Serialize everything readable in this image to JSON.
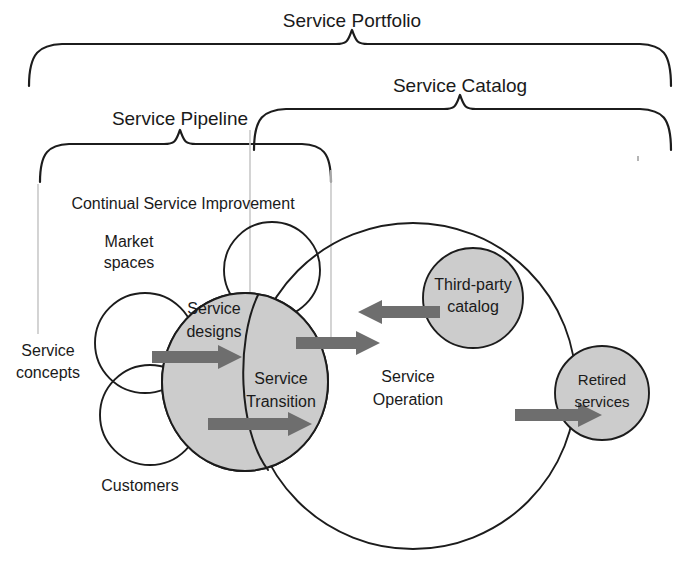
{
  "diagram": {
    "colors": {
      "ink": "#1c1c1c",
      "shade_fill": "#cccccc",
      "arrow_gray": "#6e6e6e",
      "guide_gray": "#c9c9c9",
      "background": "#ffffff"
    },
    "braces": [
      {
        "id": "service-portfolio",
        "label": "Service Portfolio",
        "label_x": 352,
        "label_y": 22,
        "left_x": 27,
        "right_x": 671,
        "tip_x": 352,
        "top_y": 40,
        "bottom_y": 86
      },
      {
        "id": "service-catalog",
        "label": "Service Catalog",
        "label_x": 460,
        "label_y": 87,
        "left_x": 252,
        "right_x": 671,
        "tip_x": 460,
        "top_y": 105,
        "bottom_y": 150
      },
      {
        "id": "service-pipeline",
        "label": "Service Pipeline",
        "label_x": 180,
        "label_y": 120,
        "left_x": 38,
        "right_x": 331,
        "tip_x": 180,
        "top_y": 138,
        "bottom_y": 182
      }
    ],
    "guide_lines": [
      {
        "id": "guide-left",
        "x": 38,
        "y1": 184,
        "y2": 334
      },
      {
        "id": "guide-mid",
        "x": 250,
        "y1": 130,
        "y2": 292
      },
      {
        "id": "guide-right",
        "x": 331,
        "y1": 170,
        "y2": 340
      }
    ],
    "section_label": {
      "id": "continual-service-improvement",
      "text": "Continual Service Improvement",
      "x": 183,
      "y": 205
    },
    "circles": [
      {
        "id": "service-operation",
        "label_lines": [
          "Service",
          "Operation"
        ],
        "cx": 413,
        "cy": 386,
        "r": 163,
        "shaded": false,
        "label_x": 408,
        "label_y": 382
      },
      {
        "id": "unnamed-upper",
        "label_lines": [],
        "cx": 272,
        "cy": 270,
        "r": 48,
        "shaded": false,
        "label_x": 272,
        "label_y": 270
      },
      {
        "id": "market-spaces",
        "label_lines": [
          "Market",
          "spaces"
        ],
        "cx": 145,
        "cy": 343,
        "r": 50,
        "shaded": false,
        "label_x": 129,
        "label_y": 252
      },
      {
        "id": "customers",
        "label_lines": [
          "Customers"
        ],
        "cx": 150,
        "cy": 415,
        "r": 50,
        "shaded": false,
        "label_x": 140,
        "label_y": 487
      },
      {
        "id": "third-party-catalog",
        "label_lines": [
          "Third-party",
          "catalog"
        ],
        "cx": 473,
        "cy": 298,
        "r": 50,
        "shaded": true,
        "label_x": 473,
        "label_y": 292
      },
      {
        "id": "retired-services",
        "label_lines": [
          "Retired",
          "services"
        ],
        "cx": 602,
        "cy": 393,
        "r": 47,
        "shaded": true,
        "label_x": 602,
        "label_y": 390
      }
    ],
    "shaded_blob": {
      "id": "service-designs-transition-blob",
      "cx": 245,
      "cy": 382,
      "rx": 83,
      "ry": 89
    },
    "inner_labels": [
      {
        "id": "service-designs",
        "lines": [
          "Service",
          "designs"
        ],
        "x": 214,
        "y": 320
      },
      {
        "id": "service-transition",
        "lines": [
          "Service",
          "Transition"
        ],
        "x": 281,
        "y": 391
      },
      {
        "id": "service-concepts",
        "lines": [
          "Service",
          "concepts"
        ],
        "x": 48,
        "y": 363
      }
    ],
    "arrows": [
      {
        "id": "arrow-concepts-to-designs",
        "x1": 152,
        "y1": 357,
        "x2": 240,
        "y2": 357,
        "dir": "right"
      },
      {
        "id": "arrow-customers-to-transition",
        "x1": 208,
        "y1": 424,
        "x2": 310,
        "y2": 424,
        "dir": "right"
      },
      {
        "id": "arrow-transition-to-operation",
        "x1": 296,
        "y1": 343,
        "x2": 378,
        "y2": 343,
        "dir": "right"
      },
      {
        "id": "arrow-thirdparty-to-operation",
        "x1": 438,
        "y1": 312,
        "x2": 360,
        "y2": 312,
        "dir": "left"
      },
      {
        "id": "arrow-operation-to-retired",
        "x1": 515,
        "y1": 415,
        "x2": 600,
        "y2": 415,
        "dir": "right"
      }
    ],
    "speck": {
      "x": 638,
      "y": 158
    }
  }
}
